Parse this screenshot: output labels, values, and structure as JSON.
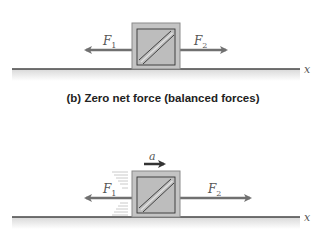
{
  "caption": "(b) Zero net force (balanced forces)",
  "axis_label": "x",
  "panel_top": {
    "forces": [
      {
        "name": "F",
        "subscript": "1",
        "direction": "left"
      },
      {
        "name": "F",
        "subscript": "2",
        "direction": "right"
      }
    ],
    "state": "stationary"
  },
  "panel_bottom": {
    "forces": [
      {
        "name": "F",
        "subscript": "1",
        "direction": "left"
      },
      {
        "name": "F",
        "subscript": "2",
        "direction": "right"
      }
    ],
    "acceleration_label": "a",
    "acceleration_direction": "right",
    "state": "accelerating"
  },
  "colors": {
    "arrow": "#707070",
    "box_fill": "#c4c4c4",
    "box_border": "#8a8a8a",
    "ground": "#444444",
    "accel_arrow": "#333333"
  }
}
